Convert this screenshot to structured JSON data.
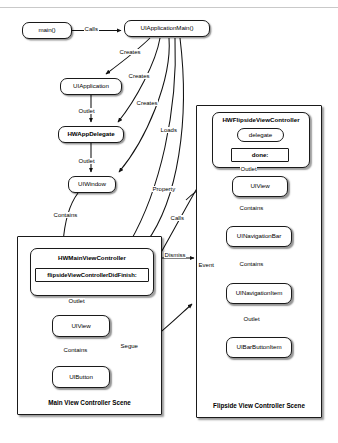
{
  "diagram": {
    "top_rule": true,
    "nodes": [
      {
        "id": "main",
        "label": "main()",
        "x": 22,
        "y": 22,
        "w": 50,
        "h": 17,
        "bold": false,
        "shape": "rounded"
      },
      {
        "id": "uiappmain",
        "label": "UIApplicationMain()",
        "x": 124,
        "y": 20,
        "w": 86,
        "h": 17,
        "bold": false,
        "shape": "rounded"
      },
      {
        "id": "uiapplication",
        "label": "UIApplication",
        "x": 60,
        "y": 78,
        "w": 62,
        "h": 17,
        "bold": false,
        "shape": "rounded"
      },
      {
        "id": "hwappdelegate",
        "label": "HWAppDelegate",
        "x": 58,
        "y": 126,
        "w": 66,
        "h": 17,
        "bold": true,
        "shape": "rounded"
      },
      {
        "id": "uiwindow",
        "label": "UIWindow",
        "x": 68,
        "y": 176,
        "w": 48,
        "h": 17,
        "bold": false,
        "shape": "rounded"
      },
      {
        "id": "mvc_uiview",
        "label": "UIView",
        "x": 52,
        "y": 315,
        "w": 58,
        "h": 22,
        "bold": false,
        "shape": "rounded"
      },
      {
        "id": "mvc_uibutton",
        "label": "UIButton",
        "x": 52,
        "y": 366,
        "w": 58,
        "h": 22,
        "bold": false,
        "shape": "rounded"
      },
      {
        "id": "fvc_uiview",
        "label": "UIView",
        "x": 232,
        "y": 176,
        "w": 56,
        "h": 21,
        "bold": false,
        "shape": "rounded"
      },
      {
        "id": "fvc_navbar",
        "label": "UINavigationBar",
        "x": 226,
        "y": 226,
        "w": 66,
        "h": 21,
        "bold": false,
        "shape": "rounded"
      },
      {
        "id": "fvc_navitem",
        "label": "UINavigationItem",
        "x": 226,
        "y": 283,
        "w": 66,
        "h": 21,
        "bold": false,
        "shape": "rounded"
      },
      {
        "id": "fvc_barbtn",
        "label": "UIBarButtonItem",
        "x": 226,
        "y": 337,
        "w": 66,
        "h": 21,
        "bold": false,
        "shape": "rounded"
      },
      {
        "id": "delegate",
        "label": "delegate",
        "x": 237,
        "y": 128,
        "w": 47,
        "h": 14,
        "bold": false,
        "shape": "rounded"
      },
      {
        "id": "done",
        "label": "done:",
        "x": 231,
        "y": 148,
        "w": 58,
        "h": 14,
        "bold": true,
        "shape": "square"
      },
      {
        "id": "flipsidedidfinish",
        "label": "flipsideViewControllerDidFinish:",
        "x": 35,
        "y": 268,
        "w": 114,
        "h": 14,
        "bold": true,
        "shape": "square"
      }
    ],
    "controller_groups": [
      {
        "id": "mvc_group",
        "title": "HWMainViewController",
        "x": 30,
        "y": 248,
        "w": 124,
        "h": 48,
        "title_x": 30,
        "title_y": 254,
        "title_w": 124
      },
      {
        "id": "fvc_group",
        "title": "HWFlipsideViewController",
        "x": 212,
        "y": 112,
        "w": 98,
        "h": 56,
        "title_x": 212,
        "title_y": 116,
        "title_w": 98
      }
    ],
    "scenes": [
      {
        "id": "main_scene",
        "label": "Main View Controller Scene",
        "x": 17,
        "y": 236,
        "w": 145,
        "h": 179,
        "label_x": 17,
        "label_y": 399,
        "label_w": 145
      },
      {
        "id": "flipside_scene",
        "label": "Flipside View Controller Scene",
        "x": 196,
        "y": 105,
        "w": 126,
        "h": 313,
        "label_x": 196,
        "label_y": 402,
        "label_w": 126
      }
    ],
    "edge_labels": [
      {
        "id": "calls-main",
        "text": "Calls",
        "x": 84,
        "y": 26
      },
      {
        "id": "creates-app",
        "text": "Creates",
        "x": 119,
        "y": 49
      },
      {
        "id": "creates-delegate",
        "text": "Creates",
        "x": 128,
        "y": 73
      },
      {
        "id": "creates-window",
        "text": "Creates",
        "x": 136,
        "y": 100
      },
      {
        "id": "loads",
        "text": "Loads",
        "x": 160,
        "y": 127
      },
      {
        "id": "outlet-app",
        "text": "Outlet",
        "x": 78,
        "y": 108
      },
      {
        "id": "outlet-delegate",
        "text": "Outlet",
        "x": 78,
        "y": 158
      },
      {
        "id": "property",
        "text": "Property",
        "x": 152,
        "y": 186
      },
      {
        "id": "calls-done",
        "text": "Calls",
        "x": 170,
        "y": 215
      },
      {
        "id": "contains-window",
        "text": "Contains",
        "x": 53,
        "y": 212
      },
      {
        "id": "dismiss",
        "text": "Dismiss",
        "x": 164,
        "y": 256
      },
      {
        "id": "outlet-mvc",
        "text": "Outlet",
        "x": 68,
        "y": 298
      },
      {
        "id": "contains-mvcview",
        "text": "Contains",
        "x": 63,
        "y": 347
      },
      {
        "id": "segue",
        "text": "Segue",
        "x": 120,
        "y": 343
      },
      {
        "id": "outlet-fvc",
        "text": "Outlet",
        "x": 240,
        "y": 168
      },
      {
        "id": "contains-fvcview",
        "text": "Contains",
        "x": 239,
        "y": 207
      },
      {
        "id": "event",
        "text": "Event",
        "x": 198,
        "y": 265
      },
      {
        "id": "contains-navbar",
        "text": "Contains",
        "x": 239,
        "y": 263
      },
      {
        "id": "outlet-navitem",
        "text": "Outlet",
        "x": 243,
        "y": 318
      }
    ],
    "colors": {
      "ink": "#1a1a1a",
      "background": "#ffffff",
      "rule": "#c9c9c9"
    }
  }
}
